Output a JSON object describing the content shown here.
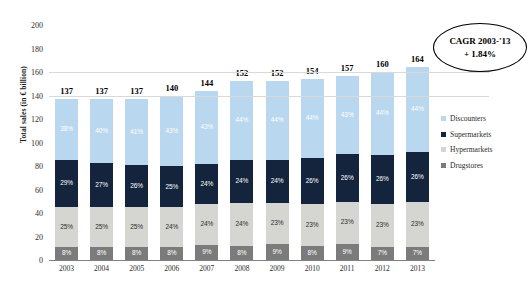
{
  "chart_data": {
    "type": "bar",
    "subtype": "stacked-bar-100-with-totals",
    "title": "",
    "xlabel": "",
    "ylabel": "Total sales (in € billion)",
    "ylim": [
      0,
      200
    ],
    "ytick_labels": [
      "0",
      "20",
      "40",
      "60",
      "80",
      "100",
      "120",
      "140",
      "160",
      "180",
      "200"
    ],
    "ytick_values": [
      0,
      20,
      40,
      60,
      80,
      100,
      120,
      140,
      160,
      180,
      200
    ],
    "grid": true,
    "legend_position": "right",
    "categories": [
      "2003",
      "2004",
      "2005",
      "2006",
      "2007",
      "2008",
      "2009",
      "2010",
      "2011",
      "2012",
      "2013"
    ],
    "totals": [
      137,
      137,
      137,
      140,
      144,
      152,
      152,
      154,
      157,
      160,
      164
    ],
    "series": [
      {
        "name": "Discounters",
        "color": "#b9d7ee",
        "values": [
          38,
          40,
          41,
          43,
          43,
          44,
          44,
          44,
          43,
          44,
          44
        ],
        "labels": [
          "38%",
          "40%",
          "41%",
          "43%",
          "43%",
          "44%",
          "44%",
          "44%",
          "43%",
          "44%",
          "44%"
        ]
      },
      {
        "name": "Supermarkets",
        "color": "#13243c",
        "values": [
          29,
          27,
          26,
          25,
          24,
          24,
          24,
          26,
          26,
          26,
          26
        ],
        "labels": [
          "29%",
          "27%",
          "26%",
          "25%",
          "24%",
          "24%",
          "24%",
          "26%",
          "26%",
          "26%",
          "26%"
        ]
      },
      {
        "name": "Hypermarkets",
        "color": "#d5d5d1",
        "values": [
          25,
          25,
          25,
          24,
          24,
          24,
          23,
          23,
          23,
          23,
          23
        ],
        "labels": [
          "25%",
          "25%",
          "25%",
          "24%",
          "24%",
          "24%",
          "23%",
          "23%",
          "23%",
          "23%",
          "23%"
        ]
      },
      {
        "name": "Drugstores",
        "color": "#7b7b7b",
        "values": [
          8,
          8,
          8,
          8,
          9,
          8,
          9,
          8,
          9,
          7,
          7
        ],
        "labels": [
          "8%",
          "8%",
          "8%",
          "8%",
          "9%",
          "8%",
          "9%",
          "8%",
          "9%",
          "7%",
          "7%"
        ]
      }
    ],
    "annotations": [
      {
        "name": "cagr-callout",
        "shape": "ellipse",
        "line1": "CAGR 2003-'13",
        "line2": "+ 1.84%"
      }
    ]
  },
  "legend": {
    "items": [
      {
        "label": "Discounters",
        "color": "#b9d7ee"
      },
      {
        "label": "Supermarkets",
        "color": "#13243c"
      },
      {
        "label": "Hypermarkets",
        "color": "#d5d5d1"
      },
      {
        "label": "Drugstores",
        "color": "#7b7b7b"
      }
    ]
  },
  "cagr": {
    "line1": "CAGR 2003-'13",
    "line2": "+ 1.84%"
  },
  "axis": {
    "y_title": "Total sales (in € billion)"
  }
}
